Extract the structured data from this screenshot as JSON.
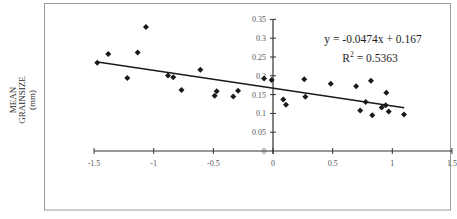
{
  "chart_data": {
    "type": "scatter",
    "title": "",
    "xlabel": "",
    "ylabel": "MEAN GRAINSIZE (mm)",
    "ylabel_lines": [
      "MEAN",
      "GRAINSIZE",
      "(mm)"
    ],
    "xlim": [
      -1.5,
      1.5
    ],
    "ylim": [
      0,
      0.35
    ],
    "grid": false,
    "legend": null,
    "x_ticks": [
      -1.5,
      -1,
      -0.5,
      0,
      0.5,
      1,
      1.5
    ],
    "x_tick_labels": [
      "-1.5",
      "-1",
      "-0.5",
      "0",
      "0.5",
      "1",
      "1.5"
    ],
    "y_ticks": [
      0,
      0.05,
      0.1,
      0.15,
      0.2,
      0.25,
      0.3,
      0.35
    ],
    "y_tick_labels": [
      "0",
      "0.05",
      "0.1",
      "0.15",
      "0.2",
      "0.25",
      "0.3",
      "0.35"
    ],
    "series": [
      {
        "name": "",
        "marker": "diamond",
        "points": [
          [
            -1.473,
            0.235
          ],
          [
            -1.381,
            0.258
          ],
          [
            -1.221,
            0.194
          ],
          [
            -1.134,
            0.262
          ],
          [
            -1.065,
            0.33
          ],
          [
            -0.88,
            0.201
          ],
          [
            -0.836,
            0.196
          ],
          [
            -0.767,
            0.162
          ],
          [
            -0.609,
            0.216
          ],
          [
            -0.489,
            0.147
          ],
          [
            -0.472,
            0.159
          ],
          [
            -0.333,
            0.145
          ],
          [
            -0.293,
            0.16
          ],
          [
            -0.075,
            0.193
          ],
          [
            -0.011,
            0.189
          ],
          [
            0.086,
            0.137
          ],
          [
            0.109,
            0.123
          ],
          [
            0.262,
            0.191
          ],
          [
            0.271,
            0.144
          ],
          [
            0.484,
            0.179
          ],
          [
            0.697,
            0.172
          ],
          [
            0.731,
            0.108
          ],
          [
            0.777,
            0.13
          ],
          [
            0.821,
            0.187
          ],
          [
            0.832,
            0.095
          ],
          [
            0.911,
            0.116
          ],
          [
            0.945,
            0.122
          ],
          [
            0.95,
            0.155
          ],
          [
            0.97,
            0.105
          ],
          [
            1.098,
            0.097
          ]
        ]
      }
    ],
    "trendline": {
      "type": "linear",
      "slope": -0.0474,
      "intercept": 0.167,
      "r_squared": 0.5363,
      "x_range": [
        -1.47,
        1.1
      ]
    },
    "annotations": {
      "equation": "y = -0.0474x + 0.167",
      "r2_prefix": "R",
      "r2_sup": "2",
      "r2_value": " = 0.5363"
    }
  },
  "colors": {
    "marker": "#1a1a1a",
    "trendline": "#1a1a1a",
    "axis": "#333333",
    "frame": "#9a9a9a",
    "tick_label": "#555555"
  }
}
